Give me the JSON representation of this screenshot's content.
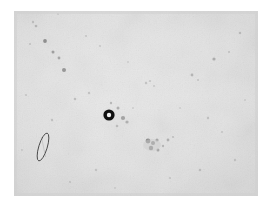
{
  "image": {
    "kind": "micrograph",
    "title": "Light micrograph field",
    "canvas_width": 271,
    "canvas_height": 209,
    "background_color": "#ffffff",
    "field": {
      "label": "specimen-field",
      "x": 14,
      "y": 11,
      "width": 244,
      "height": 185,
      "fill_color": "#e3e3e3",
      "fill_color_secondary": "#dcdcdc",
      "edge_shading_color": "#d2d2d2",
      "corner_lighten_color": "#ebebeb"
    },
    "caption": ""
  },
  "objects": {
    "ring_particle": {
      "label": "ring-particle",
      "description": "dark annular particle with light centre",
      "cx": 109,
      "cy": 115,
      "outer_radius": 5.6,
      "inner_radius": 2.2,
      "ring_color": "#111111",
      "core_color": "#f2f2f2",
      "halo_radius": 8.5,
      "halo_color": "#cfcfcf"
    },
    "rod_particle": {
      "label": "rod-particle",
      "description": "elongated outlined ellipse, fibre or rod shaped cell",
      "cx": 43,
      "cy": 147,
      "semi_major": 14.5,
      "semi_minor": 4.2,
      "rotation_deg": 17,
      "outline_color": "#4a4a4a",
      "outline_width": 0.9,
      "fill_color": "#e0e0e0"
    },
    "debris_cluster": {
      "label": "debris-cluster",
      "description": "group of dark specks lower middle right",
      "cx": 155,
      "cy": 145,
      "color": "#5a5a5a"
    }
  },
  "specks": [
    {
      "x": 45,
      "y": 41,
      "r": 1.9,
      "o": 0.55
    },
    {
      "x": 53,
      "y": 52,
      "r": 1.5,
      "o": 0.45
    },
    {
      "x": 59,
      "y": 58,
      "r": 1.4,
      "o": 0.4
    },
    {
      "x": 64,
      "y": 70,
      "r": 2.0,
      "o": 0.5
    },
    {
      "x": 36,
      "y": 26,
      "r": 1.3,
      "o": 0.28
    },
    {
      "x": 33,
      "y": 22,
      "r": 1.2,
      "o": 0.22
    },
    {
      "x": 30,
      "y": 44,
      "r": 1.1,
      "o": 0.2
    },
    {
      "x": 75,
      "y": 99,
      "r": 1.3,
      "o": 0.25
    },
    {
      "x": 89,
      "y": 93,
      "r": 1.2,
      "o": 0.22
    },
    {
      "x": 100,
      "y": 46,
      "r": 1.1,
      "o": 0.18
    },
    {
      "x": 111,
      "y": 103,
      "r": 1.2,
      "o": 0.3
    },
    {
      "x": 118,
      "y": 108,
      "r": 1.5,
      "o": 0.35
    },
    {
      "x": 123,
      "y": 118,
      "r": 2.1,
      "o": 0.42
    },
    {
      "x": 127,
      "y": 122,
      "r": 1.6,
      "o": 0.32
    },
    {
      "x": 117,
      "y": 126,
      "r": 1.3,
      "o": 0.25
    },
    {
      "x": 133,
      "y": 108,
      "r": 1.0,
      "o": 0.16
    },
    {
      "x": 146,
      "y": 83,
      "r": 1.2,
      "o": 0.22
    },
    {
      "x": 150,
      "y": 81,
      "r": 1.1,
      "o": 0.2
    },
    {
      "x": 154,
      "y": 86,
      "r": 1.0,
      "o": 0.18
    },
    {
      "x": 148,
      "y": 141,
      "r": 2.4,
      "o": 0.55
    },
    {
      "x": 153,
      "y": 143,
      "r": 2.0,
      "o": 0.5
    },
    {
      "x": 157,
      "y": 140,
      "r": 1.6,
      "o": 0.4
    },
    {
      "x": 151,
      "y": 148,
      "r": 2.2,
      "o": 0.52
    },
    {
      "x": 158,
      "y": 150,
      "r": 1.5,
      "o": 0.38
    },
    {
      "x": 163,
      "y": 146,
      "r": 1.2,
      "o": 0.28
    },
    {
      "x": 168,
      "y": 140,
      "r": 1.4,
      "o": 0.33
    },
    {
      "x": 173,
      "y": 137,
      "r": 1.1,
      "o": 0.22
    },
    {
      "x": 192,
      "y": 75,
      "r": 1.4,
      "o": 0.3
    },
    {
      "x": 198,
      "y": 80,
      "r": 1.1,
      "o": 0.2
    },
    {
      "x": 214,
      "y": 59,
      "r": 1.6,
      "o": 0.35
    },
    {
      "x": 229,
      "y": 52,
      "r": 1.1,
      "o": 0.2
    },
    {
      "x": 240,
      "y": 33,
      "r": 1.3,
      "o": 0.24
    },
    {
      "x": 208,
      "y": 118,
      "r": 1.2,
      "o": 0.22
    },
    {
      "x": 222,
      "y": 132,
      "r": 1.1,
      "o": 0.18
    },
    {
      "x": 235,
      "y": 160,
      "r": 1.2,
      "o": 0.2
    },
    {
      "x": 200,
      "y": 170,
      "r": 1.3,
      "o": 0.22
    },
    {
      "x": 170,
      "y": 178,
      "r": 1.1,
      "o": 0.18
    },
    {
      "x": 96,
      "y": 170,
      "r": 1.2,
      "o": 0.2
    },
    {
      "x": 70,
      "y": 182,
      "r": 1.1,
      "o": 0.18
    },
    {
      "x": 52,
      "y": 120,
      "r": 1.2,
      "o": 0.22
    },
    {
      "x": 26,
      "y": 95,
      "r": 1.1,
      "o": 0.18
    },
    {
      "x": 22,
      "y": 150,
      "r": 1.0,
      "o": 0.16
    },
    {
      "x": 86,
      "y": 36,
      "r": 1.1,
      "o": 0.18
    },
    {
      "x": 128,
      "y": 62,
      "r": 1.0,
      "o": 0.15
    },
    {
      "x": 180,
      "y": 108,
      "r": 1.0,
      "o": 0.15
    },
    {
      "x": 58,
      "y": 14,
      "r": 1.0,
      "o": 0.14
    },
    {
      "x": 245,
      "y": 100,
      "r": 1.0,
      "o": 0.14
    },
    {
      "x": 115,
      "y": 188,
      "r": 1.0,
      "o": 0.14
    }
  ]
}
